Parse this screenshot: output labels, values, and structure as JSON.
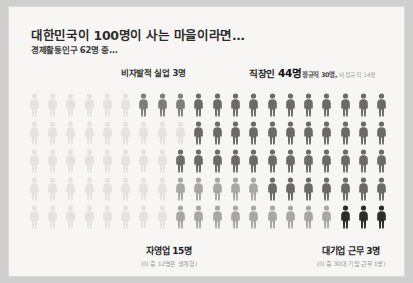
{
  "header": {
    "title": "대한민국이 100명이 사는 마을이라면…",
    "subtitle": "경제활동인구 62명 중…"
  },
  "labels": {
    "unemployed": "비자발적 실업 3명",
    "worker_prefix": "직장인 ",
    "worker_count": "44명",
    "worker_sub_regular": "정규직 30명,",
    "worker_sub_irregular": " 비정규직 14명",
    "self_employed": "자영업 15명",
    "self_employed_sub": "(이 중 12명은 생계형)",
    "big_corp": "대기업 근무 3명",
    "big_corp_sub": "(이 중 30대 기업 근무 1명)"
  },
  "colors": {
    "inactive": "#e4e3e1",
    "light": "#dad9d7",
    "medium": "#a8a7a5",
    "dark": "#7e7d7b",
    "darker": "#6b6a68",
    "black": "#2b2b2b",
    "card_bg": "#f7f6f4"
  },
  "chart_data": {
    "type": "pictogram",
    "title": "대한민국이 100명이 사는 마을이라면…",
    "subtitle": "경제활동인구 62명 중…",
    "total": 100,
    "columns": 20,
    "rows": 5,
    "categories": [
      {
        "name": "경제활동 비참여",
        "value": 38,
        "color": "#e4e3e1"
      },
      {
        "name": "비자발적 실업",
        "value": 3,
        "color": "#7e7d7b"
      },
      {
        "name": "자영업",
        "value": 15,
        "color": "#a8a7a5"
      },
      {
        "name": "직장인",
        "value": 44,
        "color": "#6b6a68"
      },
      {
        "name": "대기업 근무",
        "value": 3,
        "color": "#2b2b2b"
      }
    ],
    "notes": [
      "직장인 44명 = 정규직 30명 + 비정규직 14명",
      "자영업 15명 중 12명은 생계형",
      "대기업 근무 3명 중 30대 기업 근무 1명"
    ],
    "tones": [
      [
        0,
        0,
        0,
        0,
        0,
        0,
        3,
        3,
        3,
        2,
        2,
        2,
        2,
        2,
        2,
        2,
        2,
        2,
        2,
        2
      ],
      [
        0,
        0,
        0,
        0,
        0,
        0,
        0,
        0,
        0,
        2,
        2,
        2,
        2,
        2,
        2,
        2,
        2,
        2,
        2,
        2
      ],
      [
        0,
        0,
        0,
        0,
        0,
        0,
        0,
        0,
        2,
        2,
        2,
        2,
        2,
        2,
        2,
        2,
        2,
        2,
        2,
        2
      ],
      [
        0,
        0,
        0,
        0,
        0,
        0,
        0,
        0,
        1,
        1,
        1,
        1,
        1,
        2,
        2,
        2,
        2,
        2,
        2,
        2
      ],
      [
        0,
        0,
        0,
        0,
        0,
        0,
        0,
        0,
        1,
        1,
        1,
        1,
        1,
        1,
        1,
        1,
        1,
        4,
        4,
        4
      ]
    ]
  }
}
